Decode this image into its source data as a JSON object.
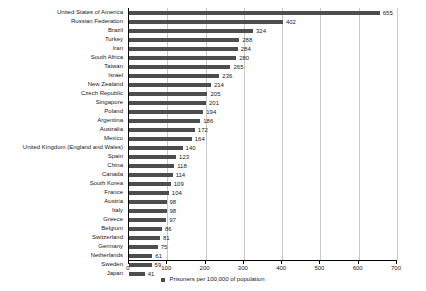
{
  "chart_data": {
    "type": "bar",
    "orientation": "horizontal",
    "title": "",
    "xlabel": "",
    "ylabel": "",
    "xlim": [
      0,
      700
    ],
    "xticks": [
      0,
      100,
      200,
      300,
      400,
      500,
      600,
      700
    ],
    "grid": true,
    "legend_position": "bottom",
    "series_name": "Prisoners per 100,000 of population",
    "bar_color": "#4d4d4d",
    "grid_color": "#c9c9c9",
    "categories": [
      "United States of America",
      "Russian Federation",
      "Brazil",
      "Turkey",
      "Iran",
      "South Africa",
      "Taiwan",
      "Israel",
      "New Zealand",
      "Czech Republic",
      "Singapore",
      "Poland",
      "Argentina",
      "Australia",
      "Mexico",
      "United Kingdom (England and Wales)",
      "Spain",
      "China",
      "Canada",
      "South Korea",
      "France",
      "Austria",
      "Italy",
      "Greece",
      "Belgium",
      "Switzerland",
      "Germany",
      "Netherlands",
      "Sweden",
      "Japan"
    ],
    "values": [
      655,
      402,
      324,
      288,
      284,
      280,
      265,
      236,
      214,
      205,
      201,
      194,
      186,
      172,
      164,
      140,
      123,
      118,
      114,
      109,
      104,
      98,
      98,
      97,
      86,
      81,
      75,
      61,
      59,
      41
    ]
  },
  "legend": {
    "label": "Prisoners per 100,000 of population"
  }
}
